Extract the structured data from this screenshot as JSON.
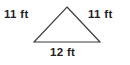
{
  "figure": {
    "kind": "geometry-diagram",
    "shape_name": "isosceles-triangle",
    "background_color": "#ffffff",
    "stroke_color": "#3a3a3a",
    "text_color": "#1f1f1f",
    "labels": {
      "left_leg": "11 ft",
      "right_leg": "11 ft",
      "base": "12 ft"
    },
    "measurements": [
      {
        "side": "left_leg",
        "value": 11,
        "unit": "ft",
        "text": "11 ft"
      },
      {
        "side": "right_leg",
        "value": 11,
        "unit": "ft",
        "text": "11 ft"
      },
      {
        "side": "base",
        "value": 12,
        "unit": "ft",
        "text": "12 ft"
      }
    ],
    "vertices": {
      "apex": {
        "x": 67,
        "y": 7
      },
      "base_left": {
        "x": 34,
        "y": 42
      },
      "base_right": {
        "x": 100,
        "y": 42
      }
    }
  }
}
